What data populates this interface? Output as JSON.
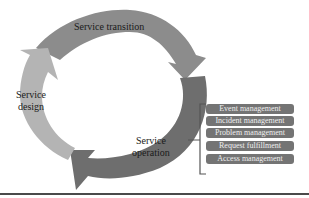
{
  "diagram": {
    "cycle_stages": [
      {
        "label_line1": "Service transition",
        "label_line2": "",
        "color": "#8c8c8c"
      },
      {
        "label_line1": "Service",
        "label_line2": "operation",
        "color": "#6e6e6e"
      },
      {
        "label_line1": "Service",
        "label_line2": "design",
        "color": "#b4b4b4"
      }
    ],
    "operation_processes": [
      "Event management",
      "Incident management",
      "Problem management",
      "Request fulfillment",
      "Access management"
    ],
    "colors": {
      "background": "#ffffff",
      "process_box": "#747474",
      "process_text": "#efefef",
      "bracket": "#555555",
      "bottom_rule": "#4a4a4a"
    }
  }
}
